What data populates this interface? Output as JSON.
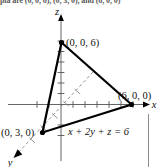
{
  "page": {
    "clipped_header_text": "pla are (0, 0, 6), (0, 3, 0), and (6, 0, 0)",
    "background_color": "#ffffff"
  },
  "figure": {
    "type": "3d-coordinate-plane-diagram",
    "equation_label": "x + 2y + z = 6",
    "axes": [
      {
        "name": "x",
        "label": "x",
        "direction": "right",
        "style": "solid",
        "arrow": true
      },
      {
        "name": "y",
        "label": "y",
        "direction": "lower-left",
        "style": "dashed",
        "arrow": true
      },
      {
        "name": "z",
        "label": "z",
        "direction": "up",
        "style": "solid",
        "arrow": true
      }
    ],
    "vertices": [
      {
        "name": "z-intercept",
        "label": "(0, 0, 6)",
        "coords": [
          0,
          0,
          6
        ]
      },
      {
        "name": "x-intercept",
        "label": "(6, 0, 0)",
        "coords": [
          6,
          0,
          0
        ]
      },
      {
        "name": "y-intercept",
        "label": "(0, 3, 0)",
        "coords": [
          0,
          3,
          0
        ]
      }
    ],
    "colors": {
      "triangle_edge": "#000000",
      "axis": "#555555",
      "dashed_axis": "#8a8a8a",
      "text": "#111111"
    },
    "ticks": {
      "x_positive_count": 6,
      "x_negative_count": 2,
      "z_positive_count": 6,
      "z_negative_count": 2,
      "y_count": 4
    }
  }
}
